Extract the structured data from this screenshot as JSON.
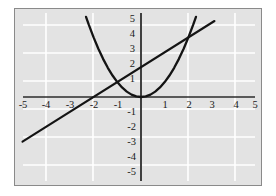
{
  "chart_data": {
    "type": "line",
    "title": "",
    "xlabel": "",
    "ylabel": "",
    "xlim": [
      -5.4,
      5.4
    ],
    "ylim": [
      -5.4,
      5.6
    ],
    "grid": true,
    "grid_step": 2,
    "grid_color": "#ffffff",
    "background_color": "#e3e3e3",
    "axis_color": "#2b2b2b",
    "curve_color": "#141414",
    "legend": "none",
    "xticks": [
      "-5",
      "-4",
      "-3",
      "-2",
      "-1",
      "1",
      "2",
      "3",
      "4",
      "5"
    ],
    "xtick_values": [
      -5,
      -4,
      -3,
      -2,
      -1,
      1,
      2,
      3,
      4,
      5
    ],
    "yticks": [
      "5",
      "4",
      "3",
      "2",
      "1",
      "-1",
      "-2",
      "-3",
      "-4",
      "-5"
    ],
    "ytick_values": [
      5,
      4,
      3,
      2,
      1,
      -1,
      -2,
      -3,
      -4,
      -5
    ],
    "series": [
      {
        "name": "parabola",
        "equation": "y = x^2",
        "type": "quadratic",
        "x_domain": [
          -2.32,
          2.32
        ],
        "points": [
          [
            -2.32,
            5.38
          ],
          [
            -2.2,
            4.84
          ],
          [
            -2.0,
            4.0
          ],
          [
            -1.8,
            3.24
          ],
          [
            -1.6,
            2.56
          ],
          [
            -1.4,
            1.96
          ],
          [
            -1.2,
            1.44
          ],
          [
            -1.0,
            1.0
          ],
          [
            -0.8,
            0.64
          ],
          [
            -0.6,
            0.36
          ],
          [
            -0.4,
            0.16
          ],
          [
            -0.2,
            0.04
          ],
          [
            0.0,
            0.0
          ],
          [
            0.2,
            0.04
          ],
          [
            0.4,
            0.16
          ],
          [
            0.6,
            0.36
          ],
          [
            0.8,
            0.64
          ],
          [
            1.0,
            1.0
          ],
          [
            1.2,
            1.44
          ],
          [
            1.4,
            1.96
          ],
          [
            1.6,
            2.56
          ],
          [
            1.8,
            3.24
          ],
          [
            2.0,
            4.0
          ],
          [
            2.2,
            4.84
          ],
          [
            2.32,
            5.38
          ]
        ]
      },
      {
        "name": "line",
        "equation": "y = x + 2",
        "type": "linear",
        "slope": 1,
        "intercept": 2,
        "x_domain": [
          -5.0,
          3.1
        ],
        "points": [
          [
            -5.0,
            -3.0
          ],
          [
            3.1,
            5.1
          ]
        ]
      }
    ],
    "intersections": [
      [
        -1,
        1
      ],
      [
        2,
        4
      ]
    ],
    "annotations": []
  },
  "figure": {
    "alt": "Graph of a parabola y = x squared and the line y = x + 2 on a gridded coordinate plane"
  }
}
